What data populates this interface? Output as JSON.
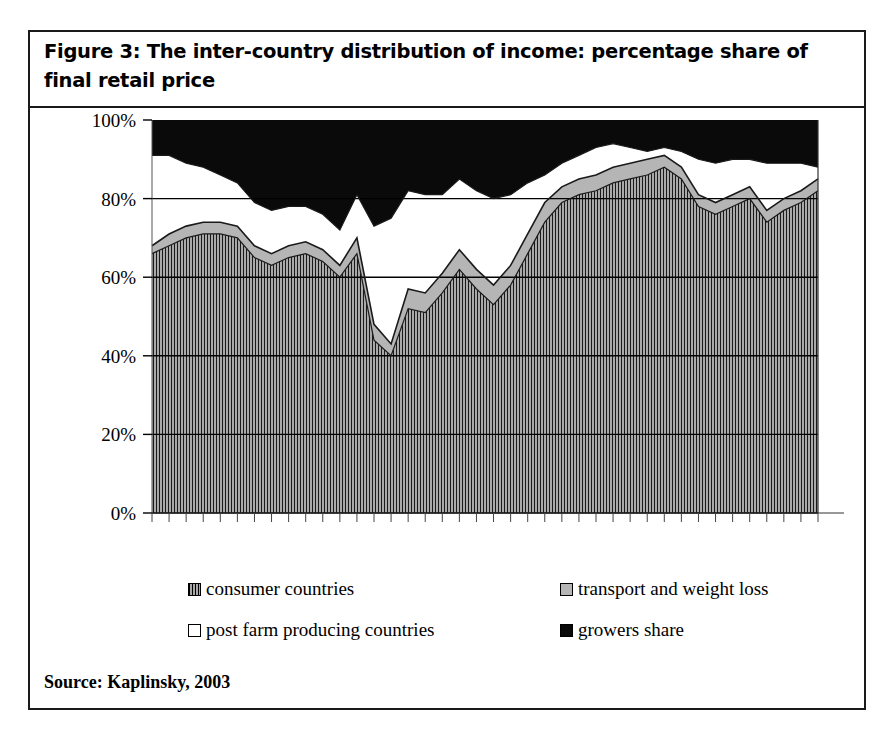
{
  "figure": {
    "title": "Figure 3: The inter-country distribution of income: percentage share of final retail price",
    "source": "Source: Kaplinsky, 2003"
  },
  "legend": {
    "position": "bottom",
    "items": [
      {
        "label": "consumer countries",
        "swatch": "hatch",
        "color": "#8f8f8f"
      },
      {
        "label": "transport and weight loss",
        "swatch": "gray",
        "color": "#b5b5b5"
      },
      {
        "label": "post farm producing countries",
        "swatch": "white",
        "color": "#ffffff"
      },
      {
        "label": "growers share",
        "swatch": "black",
        "color": "#0a0a0a"
      }
    ]
  },
  "axes": {
    "y_ticks": [
      "0%",
      "20%",
      "40%",
      "60%",
      "80%",
      "100%"
    ],
    "y_min": 0,
    "y_max": 100,
    "x_tick_count": 40,
    "grid": true
  },
  "chart_data": {
    "type": "area",
    "stacked": true,
    "title": "Figure 3: The inter-country distribution of income: percentage share of final retail price",
    "xlabel": "",
    "ylabel": "",
    "ylim": [
      0,
      100
    ],
    "grid": true,
    "legend_position": "bottom",
    "x": [
      1,
      2,
      3,
      4,
      5,
      6,
      7,
      8,
      9,
      10,
      11,
      12,
      13,
      14,
      15,
      16,
      17,
      18,
      19,
      20,
      21,
      22,
      23,
      24,
      25,
      26,
      27,
      28,
      29,
      30,
      31,
      32,
      33,
      34,
      35,
      36,
      37,
      38,
      39,
      40
    ],
    "series": [
      {
        "name": "consumer countries",
        "fill": "#8f8f8f",
        "pattern": "vertical-hatch",
        "values": [
          66,
          68,
          70,
          71,
          71,
          70,
          65,
          63,
          65,
          66,
          64,
          60,
          66,
          44,
          40,
          52,
          51,
          56,
          62,
          57,
          53,
          58,
          66,
          74,
          79,
          81,
          82,
          84,
          85,
          86,
          88,
          85,
          78,
          76,
          78,
          80,
          74,
          77,
          79,
          82
        ]
      },
      {
        "name": "transport and weight loss",
        "fill": "#b5b5b5",
        "pattern": "solid-gray",
        "values": [
          2,
          3,
          3,
          3,
          3,
          3,
          3,
          3,
          3,
          3,
          3,
          3,
          4,
          4,
          3,
          5,
          5,
          5,
          5,
          5,
          5,
          5,
          5,
          5,
          4,
          4,
          4,
          4,
          4,
          4,
          3,
          3,
          3,
          3,
          3,
          3,
          3,
          3,
          3,
          3
        ]
      },
      {
        "name": "post farm producing countries",
        "fill": "#ffffff",
        "pattern": "solid-white",
        "values": [
          23,
          20,
          16,
          14,
          12,
          11,
          11,
          11,
          10,
          9,
          9,
          9,
          11,
          25,
          32,
          25,
          25,
          20,
          18,
          20,
          22,
          18,
          13,
          7,
          6,
          6,
          7,
          6,
          4,
          2,
          2,
          4,
          9,
          10,
          9,
          7,
          12,
          9,
          7,
          3
        ]
      },
      {
        "name": "growers share",
        "fill": "#0a0a0a",
        "pattern": "solid-black",
        "values": [
          9,
          9,
          11,
          12,
          14,
          16,
          21,
          23,
          22,
          22,
          24,
          28,
          19,
          27,
          25,
          18,
          19,
          19,
          15,
          18,
          20,
          19,
          16,
          14,
          11,
          9,
          7,
          6,
          7,
          8,
          7,
          8,
          10,
          11,
          10,
          10,
          11,
          11,
          11,
          12
        ]
      }
    ]
  }
}
